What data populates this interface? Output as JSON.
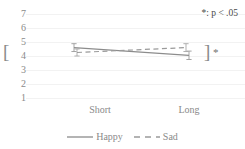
{
  "chart_data": {
    "type": "line",
    "title": "",
    "xlabel": "",
    "ylabel": "",
    "categories": [
      "Short",
      "Long"
    ],
    "series": [
      {
        "name": "Happy",
        "style": "solid",
        "color": "#8c8c8c",
        "values": [
          4.6,
          4.05
        ],
        "errors": [
          0.28,
          0.3
        ]
      },
      {
        "name": "Sad",
        "style": "dashed",
        "color": "#9a9a9a",
        "values": [
          4.25,
          4.6
        ],
        "errors": [
          0.25,
          0.28
        ]
      }
    ],
    "ylim": [
      1,
      7
    ],
    "yticks": [
      7,
      6,
      5,
      4,
      3,
      2,
      1
    ],
    "ytick_labels": [
      "7",
      "6",
      "5",
      "4",
      "3",
      "2",
      "1"
    ],
    "grid": true,
    "legend_position": "bottom",
    "annotations": [
      {
        "name": "p-value-note",
        "text": "*: p < .05"
      },
      {
        "name": "left-significance-star",
        "text": "*"
      },
      {
        "name": "left-significance-bracket",
        "text": "["
      },
      {
        "name": "right-significance-bracket",
        "text": "]"
      },
      {
        "name": "right-significance-star",
        "text": "*"
      }
    ]
  },
  "axes": {
    "y": {
      "ticks": [
        "7",
        "6",
        "5",
        "4",
        "3",
        "2",
        "1"
      ]
    },
    "x": {
      "ticks": [
        "Short",
        "Long"
      ]
    }
  },
  "legend": {
    "items": [
      {
        "label": "Happy",
        "style": "solid"
      },
      {
        "label": "Sad",
        "style": "dashed"
      }
    ]
  },
  "note": {
    "text": "*: p < .05"
  },
  "significance": {
    "left_star": "*",
    "left_bracket": "[",
    "right_bracket": "]",
    "right_star": "*"
  }
}
